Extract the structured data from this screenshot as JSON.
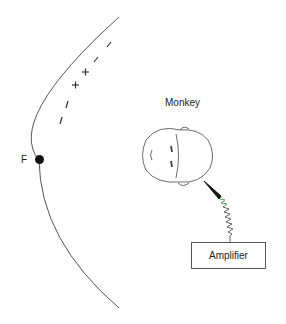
{
  "diagram": {
    "labels": {
      "subject": "Monkey",
      "fixation": "F",
      "amplifier": "Amplifier"
    },
    "arc_marks": [
      "–",
      "–",
      "+",
      "+",
      "–",
      "–"
    ],
    "colors": {
      "line": "#555555",
      "dot": "#111111",
      "electrode": "#111111",
      "spring_green": "#5a9a5a",
      "spring_blue": "#6a6aa8"
    }
  }
}
